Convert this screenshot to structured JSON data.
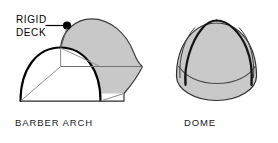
{
  "figure": {
    "background_color": "#ffffff",
    "shade_color": "#c8c8c8",
    "dome_shade_color": "#c9c9c9",
    "outline_color": "#000000",
    "thin_line_color": "#6e6e6e",
    "white_face_color": "#ffffff"
  },
  "barber_arch": {
    "caption": "BARBER ARCH",
    "callout": {
      "line1": "RIGID",
      "line2": "DECK",
      "target_marker": "filled-dot"
    }
  },
  "dome": {
    "caption": "DOME"
  }
}
